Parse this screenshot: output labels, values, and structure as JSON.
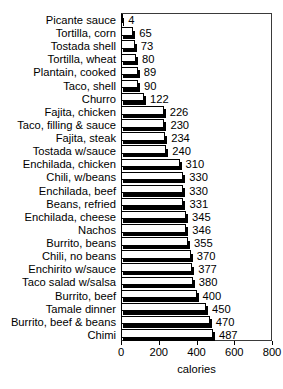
{
  "chart_data": {
    "type": "bar",
    "orientation": "horizontal",
    "title": "",
    "xlabel": "calories",
    "ylabel": "",
    "xlim": [
      0,
      800
    ],
    "xticks": [
      0,
      200,
      400,
      600,
      800
    ],
    "grid": false,
    "legend": null,
    "show_value_labels": true,
    "categories": [
      "Picante sauce",
      "Tortilla, corn",
      "Tostada shell",
      "Tortilla, wheat",
      "Plantain, cooked",
      "Taco, shell",
      "Churro",
      "Fajita, chicken",
      "Taco, filling & sauce",
      "Fajita, steak",
      "Tostada w/sauce",
      "Enchilada, chicken",
      "Chili, w/beans",
      "Enchilada, beef",
      "Beans, refried",
      "Enchilada, cheese",
      "Nachos",
      "Burrito, beans",
      "Chili, no beans",
      "Enchirito w/sauce",
      "Taco salad w/salsa",
      "Burrito, beef",
      "Tamale dinner",
      "Burrito, beef & beans",
      "Chimi"
    ],
    "values": [
      4,
      65,
      73,
      80,
      89,
      90,
      122,
      226,
      230,
      234,
      240,
      310,
      330,
      330,
      331,
      345,
      346,
      355,
      370,
      377,
      380,
      400,
      450,
      470,
      487
    ]
  },
  "axis": {
    "x_title": "calories",
    "tick_labels": [
      "0",
      "200",
      "400",
      "600",
      "800"
    ]
  },
  "style": {
    "bar_face_color": "#ffffff",
    "bar_edge_color": "#000000",
    "bar_shadow_color": "#000000",
    "background_color": "#ffffff",
    "text_color": "#000000"
  }
}
